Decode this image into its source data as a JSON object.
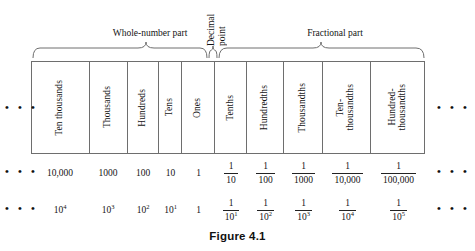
{
  "figure": {
    "caption": "Figure 4.1",
    "ellipsis": "• • •"
  },
  "braces": {
    "whole_label": "Whole-number part",
    "fractional_label": "Fractional part",
    "decimal_point_line1": "Decimal",
    "decimal_point_line2": "point"
  },
  "columns": [
    {
      "name": "Ten thousands",
      "value": "10,000",
      "power_num": "10",
      "power_exp": "4",
      "kind": "whole"
    },
    {
      "name": "Thousands",
      "value": "1000",
      "power_num": "10",
      "power_exp": "3",
      "kind": "whole"
    },
    {
      "name": "Hundreds",
      "value": "100",
      "power_num": "10",
      "power_exp": "2",
      "kind": "whole"
    },
    {
      "name": "Tens",
      "value": "10",
      "power_num": "10",
      "power_exp": "1",
      "kind": "whole"
    },
    {
      "name": "Ones",
      "value": "1",
      "power_num": "1",
      "power_exp": "",
      "kind": "whole"
    },
    {
      "name": "Tenths",
      "frac_num": "1",
      "frac_den": "10",
      "pow_num": "1",
      "pow_den": "10",
      "pow_exp": "1",
      "kind": "fraction"
    },
    {
      "name": "Hundredths",
      "frac_num": "1",
      "frac_den": "100",
      "pow_num": "1",
      "pow_den": "10",
      "pow_exp": "2",
      "kind": "fraction"
    },
    {
      "name": "Thousandths",
      "frac_num": "1",
      "frac_den": "1000",
      "pow_num": "1",
      "pow_den": "10",
      "pow_exp": "3",
      "kind": "fraction"
    },
    {
      "name": "Ten-\nthousandths",
      "frac_num": "1",
      "frac_den": "10,000",
      "pow_num": "1",
      "pow_den": "10",
      "pow_exp": "4",
      "kind": "fraction"
    },
    {
      "name": "Hundred-\nthousandths",
      "frac_num": "1",
      "frac_den": "100,000",
      "pow_num": "1",
      "pow_den": "10",
      "pow_exp": "5",
      "kind": "fraction"
    }
  ],
  "colors": {
    "rule": "#6e6e6e",
    "text": "#141414",
    "background": "#ffffff"
  }
}
